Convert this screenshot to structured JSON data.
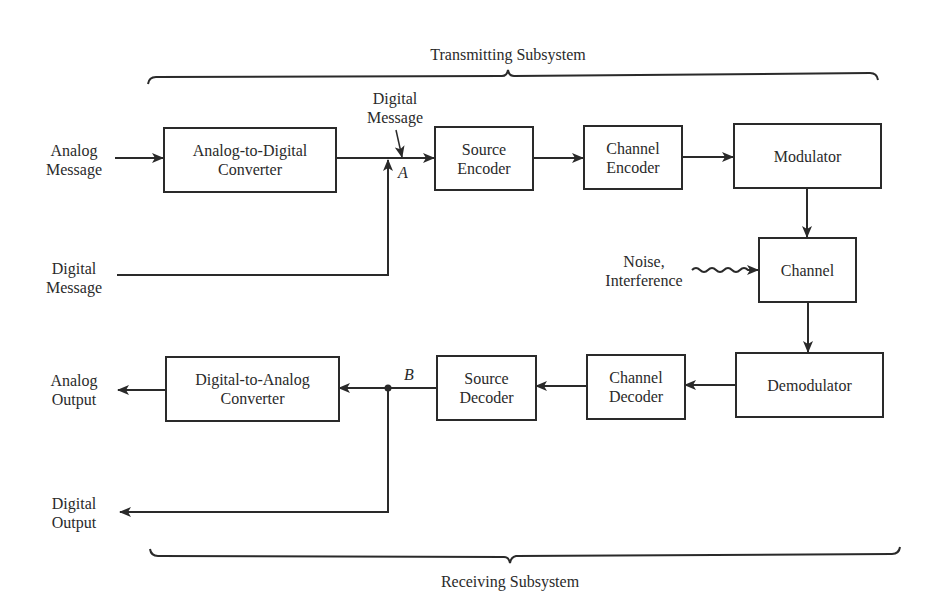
{
  "diagram": {
    "braces": {
      "top_label": "Transmitting Subsystem",
      "bottom_label": "Receiving Subsystem"
    },
    "inputs": {
      "analog_message": "Analog\nMessage",
      "digital_message": "Digital\nMessage",
      "digital_message_tag": "Digital\nMessage",
      "point_a": "A",
      "point_b": "B",
      "noise": "Noise,\nInterference"
    },
    "outputs": {
      "analog_output": "Analog\nOutput",
      "digital_output": "Digital\nOutput"
    },
    "blocks": {
      "adc": "Analog-to-Digital\nConverter",
      "source_encoder": "Source\nEncoder",
      "channel_encoder": "Channel\nEncoder",
      "modulator": "Modulator",
      "channel": "Channel",
      "demodulator": "Demodulator",
      "channel_decoder": "Channel\nDecoder",
      "source_decoder": "Source\nDecoder",
      "dac": "Digital-to-Analog\nConverter"
    },
    "colors": {
      "ink": "#2a2a2a",
      "background": "#ffffff"
    }
  }
}
